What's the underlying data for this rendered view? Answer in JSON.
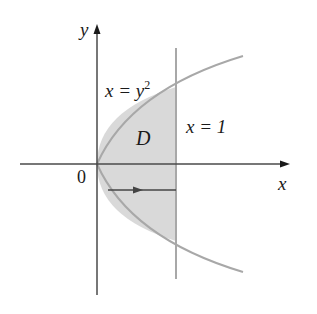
{
  "diagram": {
    "labels": {
      "y_axis": "y",
      "x_axis": "x",
      "origin": "0",
      "curve": "x = y",
      "curve_exp": "2",
      "line": "x = 1",
      "region": "D"
    },
    "colors": {
      "region_fill": "#d9d9d9",
      "curve": "#a8a8a8",
      "axes": "#4a4a4a",
      "arrow": "#444444"
    }
  }
}
